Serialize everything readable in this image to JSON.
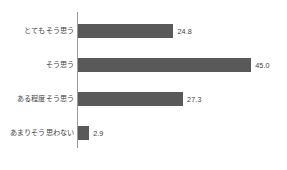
{
  "chart_data": {
    "type": "bar",
    "orientation": "horizontal",
    "title": "",
    "subtitle": "",
    "xlabel": "",
    "ylabel": "",
    "categories": [
      "とてもそう思う",
      "そう思う",
      "ある程度そう思う",
      "あまりそう思わない"
    ],
    "values": [
      24.8,
      45.0,
      27.3,
      2.9
    ],
    "value_labels": [
      "24.8",
      "45.0",
      "27.3",
      "2.9"
    ],
    "xlim": [
      0,
      45.0
    ],
    "grid": false,
    "legend": null,
    "legend_position": "none",
    "axis_line": "vertical-left",
    "bar_color": "#595959",
    "text_color": "#3f3f3f",
    "axis_color": "#9a9a9a",
    "background_color": "#ffffff"
  },
  "layout": {
    "bar_scale_px_per_unit": 3.85,
    "row_tops": [
      14,
      48,
      82,
      116
    ],
    "footer_mark": "·"
  }
}
